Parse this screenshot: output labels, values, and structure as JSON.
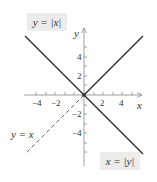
{
  "figure": {
    "labels": {
      "y_abs_x": "y = |x|",
      "x_abs_y": "x = |y|",
      "y_eq_x": "y = x"
    },
    "axes": {
      "x_label": "x",
      "y_label": "y",
      "x_ticks": [
        "−4",
        "−2",
        "2",
        "4"
      ],
      "y_ticks": [
        "4",
        "2",
        "−2",
        "−4"
      ]
    },
    "colors": {
      "line": "#333333",
      "dashed": "#666666",
      "axis": "#888888",
      "label_box": "#ececec"
    }
  }
}
